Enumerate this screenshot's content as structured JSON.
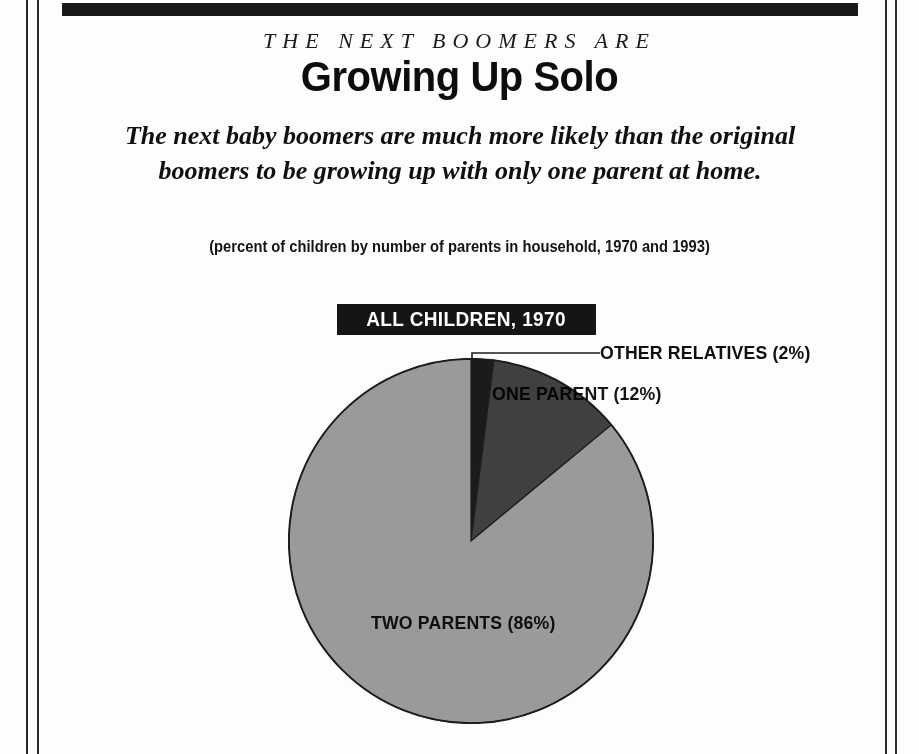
{
  "article": {
    "eyebrow": "THE NEXT BOOMERS ARE",
    "headline": "Growing Up Solo",
    "deck": "The next baby boomers are much more likely than the original boomers to be growing up with only one parent at home.",
    "subdeck": "(percent of children by number of parents in household, 1970 and 1993)"
  },
  "chart_data": {
    "type": "pie",
    "title": "ALL CHILDREN, 1970",
    "categories": [
      "Other relatives",
      "One parent",
      "Two parents"
    ],
    "values": [
      2,
      12,
      86
    ],
    "labels": [
      "OTHER RELATIVES (2%)",
      "ONE PARENT (12%)",
      "TWO PARENTS (86%)"
    ],
    "colors": [
      "#1b1b1b",
      "#404040",
      "#9a9a9a"
    ],
    "unit": "percent",
    "xlabel": "",
    "ylabel": "",
    "legend_position": "none",
    "grid": false,
    "start_angle_deg": 0,
    "direction": "clockwise",
    "notes": "percent of children by number of parents in household, 1970"
  },
  "palette": {
    "ink": "#111111",
    "plate_bg": "#151515",
    "plate_text": "#ffffff",
    "page_bg": "#fdfdfc",
    "rule": "#2b2b2b"
  }
}
